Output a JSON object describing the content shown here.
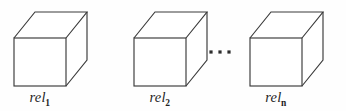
{
  "figure": {
    "type": "diagram",
    "background_color": "#fefefe",
    "line_color": "#3a3a3a",
    "label_color": "#1f1f1f",
    "cubes": [
      {
        "id": "cube-1",
        "label_base": "rel",
        "label_subscript": "1",
        "label_text": "rel1",
        "front_x": 14,
        "front_y": 38,
        "front_w": 52,
        "front_h": 48,
        "depth_dx": 21,
        "depth_dy": -26,
        "label_center_x": 40,
        "label_y": 89
      },
      {
        "id": "cube-2",
        "label_base": "rel",
        "label_subscript": "2",
        "label_text": "rel2",
        "front_x": 134,
        "front_y": 38,
        "front_w": 52,
        "front_h": 48,
        "depth_dx": 21,
        "depth_dy": -26,
        "label_center_x": 160,
        "label_y": 89
      },
      {
        "id": "cube-3",
        "label_base": "rel",
        "label_subscript": "n",
        "label_text": "reln",
        "front_x": 250,
        "front_y": 38,
        "front_w": 52,
        "front_h": 48,
        "depth_dx": 21,
        "depth_dy": -26,
        "label_center_x": 276,
        "label_y": 89
      }
    ],
    "ellipsis": {
      "name": "horizontal-ellipsis",
      "text": "...",
      "dot_size": 3.2,
      "dots": [
        {
          "cx": 211,
          "cy": 52
        },
        {
          "cx": 220,
          "cy": 52
        },
        {
          "cx": 229,
          "cy": 52
        }
      ]
    }
  }
}
